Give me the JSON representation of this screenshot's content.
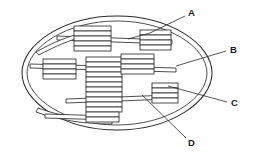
{
  "figure": {
    "background_color": "#ffffff",
    "line_color": "#2b2b2b",
    "fill_color": "#ffffff",
    "width": 254,
    "height": 158
  },
  "labels": [
    {
      "id": "A",
      "text": "A",
      "x": 190,
      "y": 13,
      "leader": "M184,16 L150,34 L128,40",
      "points_to": "outer-envelope-membrane"
    },
    {
      "id": "B",
      "text": "B",
      "x": 232,
      "y": 50,
      "leader": "M226,51 L176,66",
      "points_to": "stroma-interior"
    },
    {
      "id": "C",
      "text": "C",
      "x": 233,
      "y": 103,
      "leader": "M227,102 L168,86",
      "points_to": "granum-stack"
    },
    {
      "id": "D",
      "text": "D",
      "x": 190,
      "y": 143,
      "leader": "M186,139 L142,95",
      "points_to": "stroma-lamella"
    }
  ],
  "envelope": {
    "outer": {
      "cx": 117,
      "cy": 73,
      "rx": 95,
      "ry": 57
    },
    "inner": {
      "cx": 117,
      "cy": 73,
      "rx": 90,
      "ry": 52
    }
  },
  "grana": [
    {
      "name": "granum-top-center",
      "x": 74,
      "y": 27,
      "w": 37,
      "h": 25,
      "discs": 5
    },
    {
      "name": "granum-top-right",
      "x": 140,
      "y": 30,
      "w": 31,
      "h": 23,
      "discs": 4
    },
    {
      "name": "granum-left",
      "x": 43,
      "y": 60,
      "w": 33,
      "h": 22,
      "discs": 4
    },
    {
      "name": "granum-center",
      "x": 86,
      "y": 57,
      "w": 36,
      "h": 58,
      "discs": 10
    },
    {
      "name": "granum-mid-right",
      "x": 121,
      "y": 55,
      "w": 33,
      "h": 22,
      "discs": 4
    },
    {
      "name": "granum-lower-right",
      "x": 152,
      "y": 84,
      "w": 26,
      "h": 22,
      "discs": 4
    }
  ],
  "lamellae": [
    {
      "name": "lamella-upper",
      "x1": 57,
      "y1": 38,
      "x2": 172,
      "y2": 42
    },
    {
      "name": "lamella-mid",
      "x1": 30,
      "y1": 66,
      "x2": 176,
      "y2": 70
    },
    {
      "name": "lamella-lower",
      "x1": 66,
      "y1": 101,
      "x2": 170,
      "y2": 97
    },
    {
      "name": "lamella-bottom",
      "x1": 45,
      "y1": 116,
      "x2": 112,
      "y2": 118
    }
  ]
}
